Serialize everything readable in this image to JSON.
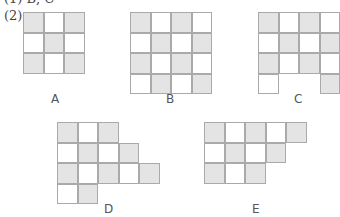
{
  "header": {
    "prev_answer": "(1) B, C",
    "question_number": "(2)"
  },
  "colors": {
    "shaded": "#e4e4e4",
    "border": "#aaaaaa"
  },
  "figures": [
    {
      "label": "A",
      "left": 23,
      "top": 12,
      "rows": [
        "GWG",
        "WGW",
        "GWG"
      ],
      "label_x": 51,
      "label_y": 92
    },
    {
      "label": "B",
      "left": 130,
      "top": 12,
      "rows": [
        "GWGW",
        "WGWG",
        "GWGW",
        "WGWG"
      ],
      "label_x": 166,
      "label_y": 92
    },
    {
      "label": "C",
      "left": 258,
      "top": 12,
      "rows": [
        "GWGW",
        "WGWG",
        "GWGW",
        "W..G"
      ],
      "label_x": 294,
      "label_y": 92
    },
    {
      "label": "D",
      "left": 57,
      "top": 122,
      "rows": [
        "GWG",
        "WGWG",
        "GWGWG",
        "WG"
      ],
      "label_x": 104,
      "label_y": 202
    },
    {
      "label": "E",
      "left": 204,
      "top": 122,
      "rows": [
        "GWGWG",
        "WGWG",
        "GWG"
      ],
      "label_x": 252,
      "label_y": 202
    }
  ]
}
